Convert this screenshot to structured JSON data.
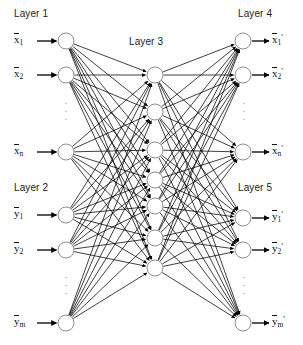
{
  "diagram": {
    "title_visible": false,
    "background_color": "#ffffff",
    "node_fill": "#ffffff",
    "node_stroke": "#808080",
    "edge_color": "#000000",
    "text_color": "#111111",
    "node_radius": 8,
    "layers": [
      {
        "id": "layer1",
        "title": "Layer 1",
        "title_x": 14,
        "title_y": 8,
        "column_x": 66,
        "nodes": [
          {
            "id": "l1n1",
            "cy": 41,
            "label": "x",
            "sub": "1",
            "prime": ""
          },
          {
            "id": "l1n2",
            "cy": 75,
            "label": "x",
            "sub": "2",
            "prime": ""
          },
          {
            "id": "l1n3",
            "cy": 152,
            "label": "x",
            "sub": "n",
            "prime": ""
          }
        ],
        "ellipsis": {
          "x": 63,
          "y": 100,
          "count": 3
        },
        "label_side": "left",
        "arrow_direction": "in"
      },
      {
        "id": "layer2",
        "title": "Layer 2",
        "title_x": 14,
        "title_y": 182,
        "column_x": 66,
        "nodes": [
          {
            "id": "l2n1",
            "cy": 215,
            "label": "y",
            "sub": "1",
            "prime": ""
          },
          {
            "id": "l2n2",
            "cy": 250,
            "label": "y",
            "sub": "2",
            "prime": ""
          },
          {
            "id": "l2n3",
            "cy": 323,
            "label": "y",
            "sub": "m",
            "prime": ""
          }
        ],
        "ellipsis": {
          "x": 63,
          "y": 274,
          "count": 3
        },
        "label_side": "left",
        "arrow_direction": "in"
      },
      {
        "id": "layer3",
        "title": "Layer 3",
        "title_x": 129,
        "title_y": 36,
        "column_x": 155,
        "nodes": [
          {
            "id": "l3n1",
            "cy": 75,
            "label": "",
            "sub": "",
            "prime": ""
          },
          {
            "id": "l3n2",
            "cy": 112,
            "label": "",
            "sub": "",
            "prime": ""
          },
          {
            "id": "l3n3",
            "cy": 150,
            "label": "",
            "sub": "",
            "prime": ""
          },
          {
            "id": "l3n4",
            "cy": 180,
            "label": "",
            "sub": "",
            "prime": ""
          },
          {
            "id": "l3n5",
            "cy": 206,
            "label": "",
            "sub": "",
            "prime": ""
          },
          {
            "id": "l3n6",
            "cy": 238,
            "label": "",
            "sub": "",
            "prime": ""
          },
          {
            "id": "l3n7",
            "cy": 268,
            "label": "",
            "sub": "",
            "prime": ""
          }
        ],
        "ellipsis": null,
        "label_side": "none",
        "arrow_direction": "none"
      },
      {
        "id": "layer4",
        "title": "Layer 4",
        "title_x": 238,
        "title_y": 8,
        "column_x": 243,
        "nodes": [
          {
            "id": "l4n1",
            "cy": 41,
            "label": "x",
            "sub": "1",
            "prime": "'"
          },
          {
            "id": "l4n2",
            "cy": 75,
            "label": "x",
            "sub": "2",
            "prime": "'"
          },
          {
            "id": "l4n3",
            "cy": 152,
            "label": "x",
            "sub": "n",
            "prime": "'"
          }
        ],
        "ellipsis": {
          "x": 241,
          "y": 100,
          "count": 3
        },
        "label_side": "right",
        "arrow_direction": "out"
      },
      {
        "id": "layer5",
        "title": "Layer 5",
        "title_x": 238,
        "title_y": 182,
        "column_x": 243,
        "nodes": [
          {
            "id": "l5n1",
            "cy": 218,
            "label": "y",
            "sub": "1",
            "prime": "'"
          },
          {
            "id": "l5n2",
            "cy": 250,
            "label": "y",
            "sub": "2",
            "prime": "'"
          },
          {
            "id": "l5n3",
            "cy": 323,
            "label": "y",
            "sub": "m",
            "prime": "'"
          }
        ],
        "ellipsis": {
          "x": 241,
          "y": 274,
          "count": 3
        },
        "label_side": "right",
        "arrow_direction": "out"
      }
    ],
    "connections": [
      {
        "from": "layer1",
        "to": "layer3",
        "style": "fully-connected"
      },
      {
        "from": "layer2",
        "to": "layer3",
        "style": "fully-connected"
      },
      {
        "from": "layer3",
        "to": "layer4",
        "style": "fully-connected"
      },
      {
        "from": "layer3",
        "to": "layer5",
        "style": "fully-connected"
      }
    ]
  }
}
